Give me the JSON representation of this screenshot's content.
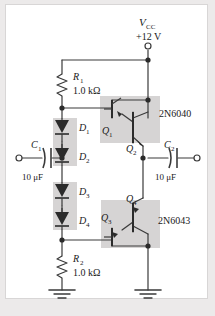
{
  "circuit": {
    "title": "Class AB push-pull Darlington power amplifier",
    "supply": {
      "name": "V",
      "subscript": "CC",
      "voltage": "+12 V",
      "terminal_icon": "open-terminal-icon"
    },
    "resistors": [
      {
        "ref": "R",
        "sub": "1",
        "value": "1.0 kΩ"
      },
      {
        "ref": "R",
        "sub": "2",
        "value": "1.0 kΩ"
      }
    ],
    "capacitors": [
      {
        "ref": "C",
        "sub": "1",
        "value": "10 μF",
        "role": "input-coupling"
      },
      {
        "ref": "C",
        "sub": "2",
        "value": "10 μF",
        "role": "output-coupling"
      }
    ],
    "diodes": [
      {
        "ref": "D",
        "sub": "1"
      },
      {
        "ref": "D",
        "sub": "2"
      },
      {
        "ref": "D",
        "sub": "3"
      },
      {
        "ref": "D",
        "sub": "4"
      }
    ],
    "transistors": [
      {
        "ref": "Q",
        "sub": "1",
        "type": "npn"
      },
      {
        "ref": "Q",
        "sub": "2",
        "type": "npn"
      },
      {
        "ref": "Q",
        "sub": "3",
        "type": "pnp"
      },
      {
        "ref": "Q",
        "sub": "4",
        "type": "pnp"
      }
    ],
    "part_numbers": [
      {
        "label": "2N6040",
        "for": "upper-darlington"
      },
      {
        "label": "2N6043",
        "for": "lower-darlington"
      }
    ],
    "grounds": [
      {
        "name": "ground-left"
      },
      {
        "name": "ground-right"
      }
    ],
    "colors": {
      "wire": "#3a3a3a",
      "shade": "#d6d4d4",
      "page": "#ffffff",
      "border": "#d8d6d6",
      "outer": "#eceaea",
      "text": "#1a1a1a"
    }
  }
}
